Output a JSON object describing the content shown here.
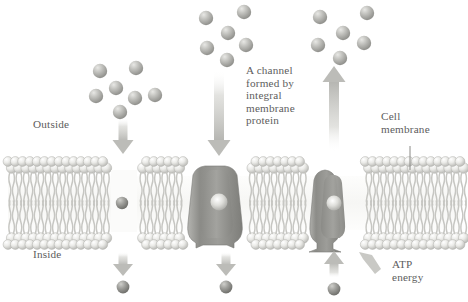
{
  "diagram": {
    "labels": {
      "outside": "Outside",
      "inside": "Inside",
      "channel": "A channel\nformed by\nintegral\nmembrane\nprotein",
      "cell_membrane": "Cell\nmembrane",
      "atp": "ATP\nenergy"
    },
    "colors": {
      "text": "#5d5d5d",
      "head_light": "#f2f2f0",
      "head_mid": "#d4d4d0",
      "head_dark": "#a8a8a4",
      "tail": "#c9c9c5",
      "protein_dark": "#8e8e8a",
      "protein_mid": "#a5a5a1",
      "protein_light": "#bdbdb9",
      "molecule_light": "#cfcfcb",
      "molecule_mid": "#a6a6a2",
      "molecule_dark": "#8a8a86",
      "arrow": "#c4c4c0",
      "background": "#ffffff"
    },
    "membrane": {
      "x": 8,
      "width": 452,
      "top_y": 163,
      "bottom_y": 243,
      "lipid_count": 62,
      "description": "phospholipid bilayer with spherical heads and paired wavy tails"
    },
    "molecule_clusters": [
      {
        "name": "simple-diffusion-cluster",
        "count": 7,
        "points": [
          [
            100,
            71
          ],
          [
            136,
            68
          ],
          [
            116,
            88
          ],
          [
            96,
            96
          ],
          [
            135,
            98
          ],
          [
            155,
            95
          ],
          [
            120,
            112
          ]
        ]
      },
      {
        "name": "channel-diffusion-cluster",
        "count": 6,
        "points": [
          [
            206,
            18
          ],
          [
            244,
            12
          ],
          [
            228,
            33
          ],
          [
            207,
            48
          ],
          [
            246,
            45
          ],
          [
            227,
            60
          ]
        ]
      },
      {
        "name": "active-transport-cluster",
        "count": 6,
        "points": [
          [
            320,
            17
          ],
          [
            367,
            13
          ],
          [
            343,
            33
          ],
          [
            318,
            45
          ],
          [
            364,
            43
          ],
          [
            340,
            58
          ]
        ]
      }
    ],
    "transport_pathways": [
      {
        "name": "simple-diffusion",
        "direction": "down",
        "arrow_top": [
          123,
          118
        ],
        "arrow_bottom": [
          123,
          150
        ],
        "has_protein": false,
        "exit_arrow": [
          123,
          252
        ],
        "exit_molecule": [
          123,
          287
        ]
      },
      {
        "name": "channel-mediated-diffusion",
        "direction": "down",
        "arrow_top": [
          219,
          70
        ],
        "arrow_bottom": [
          219,
          158
        ],
        "has_protein": true,
        "protein_type": "funnel-channel",
        "exit_arrow": [
          226,
          252
        ],
        "exit_molecule": [
          226,
          287
        ]
      },
      {
        "name": "active-transport-pump",
        "direction": "up",
        "arrow_top": [
          334,
          66
        ],
        "arrow_bottom": [
          334,
          158
        ],
        "has_protein": true,
        "protein_type": "pump",
        "exit_arrow": [
          334,
          252
        ],
        "exit_molecule": [
          334,
          287
        ]
      }
    ],
    "leader_lines": [
      {
        "name": "cell-membrane-leader",
        "x": 410,
        "y1": 146,
        "y2": 170
      }
    ],
    "label_positions": {
      "outside": [
        33,
        118
      ],
      "inside": [
        33,
        248
      ],
      "channel": [
        246,
        64
      ],
      "cell_membrane": [
        381,
        110
      ],
      "atp": [
        392,
        258
      ]
    }
  }
}
